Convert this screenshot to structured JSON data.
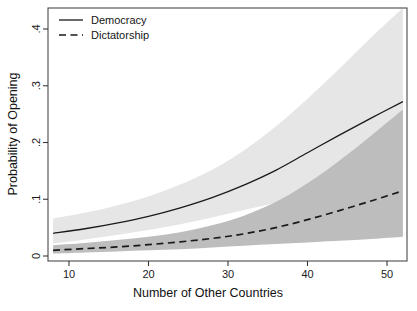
{
  "chart_data": {
    "type": "line",
    "title": "",
    "xlabel": "Number of Other Countries",
    "ylabel": "Probability of Opening",
    "xlim": [
      8,
      52
    ],
    "ylim": [
      0,
      0.44
    ],
    "xticks": [
      10,
      20,
      30,
      40,
      50
    ],
    "xticklabels": [
      "10",
      "20",
      "30",
      "40",
      "50"
    ],
    "yticks": [
      0,
      0.1,
      0.2,
      0.3,
      0.4
    ],
    "yticklabels": [
      "0",
      ".1",
      ".2",
      ".3",
      ".4"
    ],
    "grid": false,
    "legend_position": "upper-left-inside",
    "x": [
      8,
      12,
      16,
      20,
      24,
      28,
      32,
      36,
      40,
      44,
      48,
      52
    ],
    "series": [
      {
        "name": "Democracy",
        "style": "solid",
        "color": "#1a1a1a",
        "values": [
          0.04,
          0.048,
          0.058,
          0.07,
          0.085,
          0.103,
          0.125,
          0.151,
          0.182,
          0.213,
          0.243,
          0.272
        ],
        "ci_lower": [
          0.022,
          0.029,
          0.037,
          0.046,
          0.056,
          0.068,
          0.081,
          0.094,
          0.108,
          0.122,
          0.134,
          0.147
        ],
        "ci_upper": [
          0.066,
          0.076,
          0.089,
          0.105,
          0.126,
          0.152,
          0.186,
          0.228,
          0.277,
          0.33,
          0.385,
          0.437
        ],
        "band_color": "#e6e6e6"
      },
      {
        "name": "Dictatorship",
        "style": "dashed",
        "color": "#1a1a1a",
        "values": [
          0.01,
          0.013,
          0.016,
          0.02,
          0.025,
          0.031,
          0.039,
          0.05,
          0.064,
          0.08,
          0.097,
          0.115
        ],
        "ci_lower": [
          0.004,
          0.006,
          0.008,
          0.01,
          0.012,
          0.015,
          0.018,
          0.021,
          0.024,
          0.027,
          0.03,
          0.034
        ],
        "ci_upper": [
          0.019,
          0.023,
          0.028,
          0.034,
          0.042,
          0.054,
          0.071,
          0.095,
          0.128,
          0.168,
          0.212,
          0.258
        ],
        "band_color": "#bdbdbd"
      }
    ],
    "legend": [
      {
        "label": "Democracy",
        "style": "solid"
      },
      {
        "label": "Dictatorship",
        "style": "dashed"
      }
    ]
  },
  "colors": {
    "axis": "#3a3a3a",
    "line": "#1a1a1a",
    "band_light": "#e6e6e6",
    "band_dark": "#bdbdbd",
    "background": "#ffffff"
  }
}
